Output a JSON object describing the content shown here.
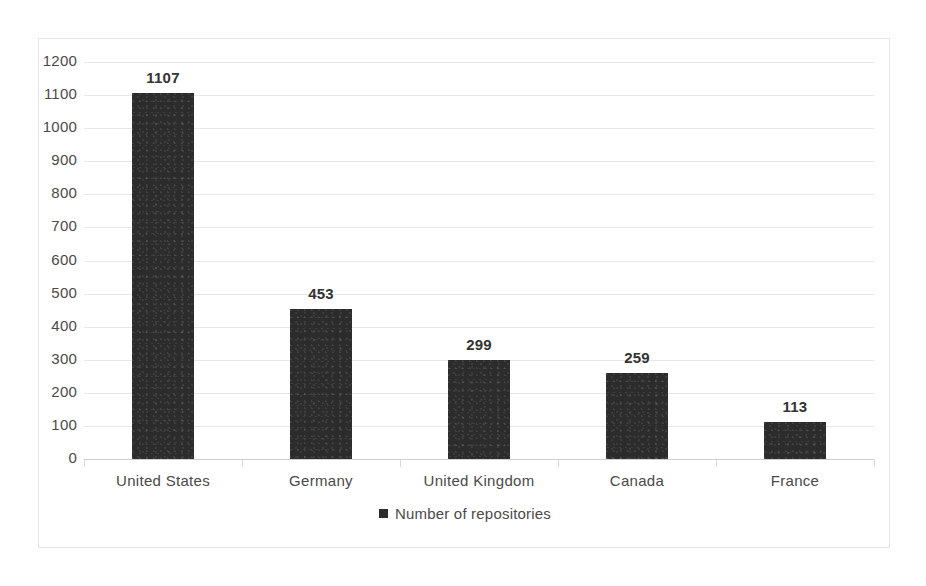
{
  "chart_data": {
    "type": "bar",
    "title": "",
    "subtitle": "",
    "xlabel": "",
    "ylabel": "",
    "categories": [
      "United States",
      "Germany",
      "United Kingdom",
      "Canada",
      "France"
    ],
    "values": [
      1107,
      453,
      299,
      259,
      113
    ],
    "series": [
      {
        "name": "Number of repositories",
        "values": [
          1107,
          453,
          299,
          259,
          113
        ],
        "color": "#2c2c2c"
      }
    ],
    "data_labels": [
      "1107",
      "453",
      "299",
      "259",
      "113"
    ],
    "ylim": [
      0,
      1200
    ],
    "ytick_step": 100,
    "ytick_labels": [
      "0",
      "100",
      "200",
      "300",
      "400",
      "500",
      "600",
      "700",
      "800",
      "900",
      "1000",
      "1100",
      "1200"
    ],
    "grid": true,
    "grid_axis": "y",
    "legend": {
      "visible": true,
      "position": "bottom",
      "entries": [
        {
          "label": "Number of repositories",
          "color": "#2c2c2c"
        }
      ]
    },
    "colors": {
      "bar": "#2c2c2c",
      "gridline": "#e8e8e8",
      "axis": "#d0d0d0",
      "text": "#4a4a4a",
      "border": "#e3e3e3",
      "background": "#ffffff"
    }
  }
}
